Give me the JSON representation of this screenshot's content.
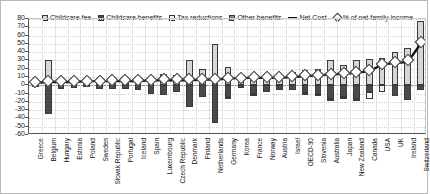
{
  "chart_data": {
    "type": "bar",
    "title": "",
    "xlabel": "",
    "ylabel": "",
    "ylim": [
      -60,
      80
    ],
    "ytick_step": 10,
    "yticks": [
      80,
      70,
      60,
      50,
      40,
      30,
      20,
      10,
      0,
      -10,
      -20,
      -30,
      -40,
      -50,
      -60
    ],
    "grid": true,
    "legend_position": "top",
    "stacked": true,
    "categories": [
      "Greece",
      "Belgium",
      "Hungary",
      "Estonia",
      "Poland",
      "Sweden",
      "Slovak Republic",
      "Portugal",
      "Iceland",
      "Spain",
      "Luxembourg",
      "Czech Republic",
      "Denmark",
      "Finland",
      "Netherlands",
      "Germany",
      "Korea",
      "France",
      "Norway",
      "Austria",
      "Israel",
      "OECD-30",
      "Slovenia",
      "Australia",
      "Japan",
      "New Zealand",
      "Canada",
      "USA",
      "UK",
      "Ireland",
      "Switzerland"
    ],
    "series": [
      {
        "name": "Childcare fee",
        "color": "#d6d6d6",
        "values": [
          5,
          30,
          6,
          5,
          5,
          8,
          6,
          7,
          10,
          10,
          14,
          12,
          30,
          20,
          50,
          22,
          12,
          14,
          14,
          13,
          16,
          18,
          20,
          30,
          25,
          30,
          32,
          33,
          40,
          45,
          78
        ]
      },
      {
        "name": "Childcare benefits",
        "color": "#4a4a4a",
        "values": [
          -2,
          -35,
          -4,
          -3,
          -2,
          -5,
          -4,
          -4,
          -6,
          -10,
          -12,
          -8,
          -26,
          -14,
          -45,
          -14,
          -3,
          -10,
          -8,
          -6,
          -6,
          -9,
          -11,
          -17,
          -14,
          -16,
          -8,
          0,
          -13,
          -18,
          -6
        ]
      },
      {
        "name": "Tax reductions",
        "color": "#f4f4f4",
        "values": [
          0,
          0,
          0,
          0,
          0,
          0,
          0,
          0,
          0,
          0,
          0,
          0,
          0,
          0,
          0,
          -2,
          0,
          -1,
          0,
          0,
          0,
          -1,
          -1,
          -2,
          -2,
          -1,
          -8,
          -8,
          0,
          0,
          0
        ]
      },
      {
        "name": "Other benefits",
        "color": "#8a8a8a",
        "values": [
          0,
          0,
          0,
          0,
          0,
          0,
          0,
          0,
          0,
          0,
          0,
          0,
          0,
          0,
          0,
          0,
          0,
          0,
          0,
          0,
          0,
          0,
          0,
          0,
          0,
          0,
          0,
          0,
          0,
          0,
          0
        ]
      }
    ],
    "net_cost": {
      "name": "Net Cost",
      "color": "#111111",
      "values": [
        3,
        4,
        4,
        4,
        5,
        5,
        5,
        5,
        5,
        6,
        6,
        6,
        6,
        7,
        7,
        8,
        9,
        9,
        9,
        9,
        10,
        11,
        12,
        13,
        14,
        15,
        17,
        25,
        27,
        28,
        50
      ]
    },
    "pct_net_family_income": {
      "name": "% of net family income",
      "marker": "diamond",
      "color": "#ffffff",
      "values": [
        4,
        5,
        5,
        5,
        5,
        5,
        6,
        6,
        6,
        6,
        7,
        7,
        7,
        8,
        8,
        9,
        9,
        10,
        10,
        10,
        11,
        12,
        13,
        14,
        15,
        16,
        19,
        26,
        28,
        30,
        52
      ]
    }
  },
  "legend": {
    "items": [
      {
        "label": "Childcare fee",
        "swatch": "fee-swatch"
      },
      {
        "label": "Childcare benefits",
        "swatch": "childcare-benefits-swatch"
      },
      {
        "label": "Tax reductions",
        "swatch": "tax-reductions-swatch"
      },
      {
        "label": "Other benefits",
        "swatch": "other-benefits-swatch"
      },
      {
        "label": "Net Cost",
        "swatch": "net-cost-line-swatch"
      },
      {
        "label": "% of net family income",
        "swatch": "pct-income-marker-swatch"
      }
    ]
  }
}
